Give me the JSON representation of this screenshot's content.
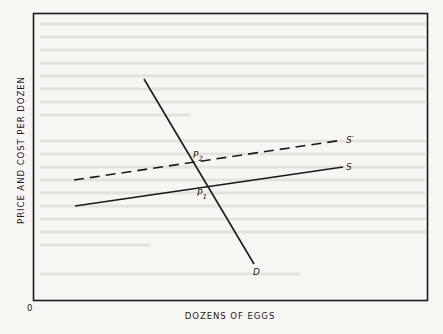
{
  "axes": {
    "y_label": "PRICE AND COST PER DOZEN",
    "x_label": "DOZENS OF EGGS",
    "origin_label": "0"
  },
  "curves": {
    "demand": {
      "label": "D",
      "style": "solid"
    },
    "supply": {
      "label": "S",
      "style": "solid"
    },
    "supply_shifted": {
      "label": "S′",
      "style": "dashed"
    }
  },
  "points": {
    "p1": {
      "label": "P",
      "subscript": "1"
    },
    "p2": {
      "label": "P",
      "subscript": "2"
    }
  },
  "colors": {
    "ink": "#1a1a1a",
    "paper": "#f7f6f2"
  }
}
